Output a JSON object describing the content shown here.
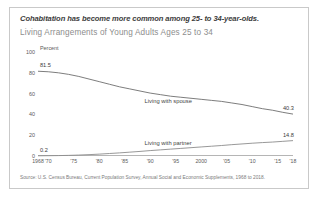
{
  "figure": {
    "title": "Cohabitation has become more common among 25- to 34-year-olds.",
    "subtitle": "Living Arrangements of Young Adults Ages 25 to 34",
    "source": "Source: U.S. Census Bureau, Current Population Survey, Annual Social and Economic Supplements, 1968 to 2018.",
    "unit_label": "Percent"
  },
  "chart_data": {
    "type": "line",
    "title": "Living Arrangements of Young Adults Ages 25 to 34",
    "xlabel": "",
    "ylabel": "Percent",
    "ylim": [
      0,
      100
    ],
    "yticks": [
      0,
      20,
      40,
      60,
      80,
      100
    ],
    "xlim": [
      1968,
      2018
    ],
    "xticks": [
      1968,
      1970,
      1975,
      1980,
      1985,
      1990,
      1995,
      2000,
      2005,
      2010,
      2015,
      2018
    ],
    "xtick_labels": [
      "1968",
      "'70",
      "'75",
      "'80",
      "'85",
      "'90",
      "'95",
      "2000",
      "'05",
      "'10",
      "'15",
      "'18"
    ],
    "grid": false,
    "legend_position": "inline-annotation",
    "annotations": [
      {
        "text": "Living with spouse",
        "x": 1994,
        "y": 52
      },
      {
        "text": "Living with partner",
        "x": 1994,
        "y": 12
      }
    ],
    "data_labels": [
      {
        "text": "81.5",
        "x": 1968,
        "y": 81.5
      },
      {
        "text": "40.3",
        "x": 2018,
        "y": 40.3
      },
      {
        "text": "0.2",
        "x": 1968,
        "y": 0.2
      },
      {
        "text": "14.8",
        "x": 2018,
        "y": 14.8
      }
    ],
    "series": [
      {
        "name": "Living with spouse",
        "color": "#6e6e6e",
        "x": [
          1968,
          1970,
          1972,
          1974,
          1976,
          1978,
          1980,
          1982,
          1984,
          1986,
          1988,
          1990,
          1992,
          1994,
          1996,
          1998,
          2000,
          2002,
          2004,
          2006,
          2008,
          2010,
          2012,
          2014,
          2016,
          2018
        ],
        "values": [
          81.5,
          81.0,
          80.0,
          78.5,
          76.5,
          74.0,
          71.5,
          69.0,
          66.5,
          64.5,
          62.5,
          60.5,
          59.0,
          57.5,
          56.5,
          55.5,
          54.5,
          53.5,
          52.5,
          51.0,
          49.5,
          47.5,
          45.5,
          44.0,
          42.0,
          40.3
        ]
      },
      {
        "name": "Living with partner",
        "color": "#8c8c8c",
        "x": [
          1968,
          1970,
          1972,
          1974,
          1976,
          1978,
          1980,
          1982,
          1984,
          1986,
          1988,
          1990,
          1992,
          1994,
          1996,
          1998,
          2000,
          2002,
          2004,
          2006,
          2008,
          2010,
          2012,
          2014,
          2016,
          2018
        ],
        "values": [
          0.2,
          0.3,
          0.4,
          0.6,
          0.9,
          1.3,
          1.8,
          2.4,
          3.0,
          3.7,
          4.4,
          5.2,
          5.9,
          6.6,
          7.3,
          8.0,
          8.7,
          9.4,
          10.1,
          10.9,
          11.6,
          12.3,
          12.9,
          13.4,
          14.1,
          14.8
        ]
      }
    ]
  }
}
